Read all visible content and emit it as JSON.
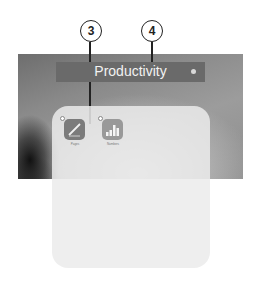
{
  "callouts": [
    {
      "number": "3"
    },
    {
      "number": "4"
    }
  ],
  "folder": {
    "title": "Productivity",
    "apps": [
      {
        "name": "Pages",
        "icon": "pages-pen-icon"
      },
      {
        "name": "Numbers",
        "icon": "numbers-bar-chart-icon"
      }
    ]
  },
  "colors": {
    "title_bar": "#6a6a6a",
    "folder_bg": "#ebebeb",
    "callout_stroke": "#222222"
  }
}
